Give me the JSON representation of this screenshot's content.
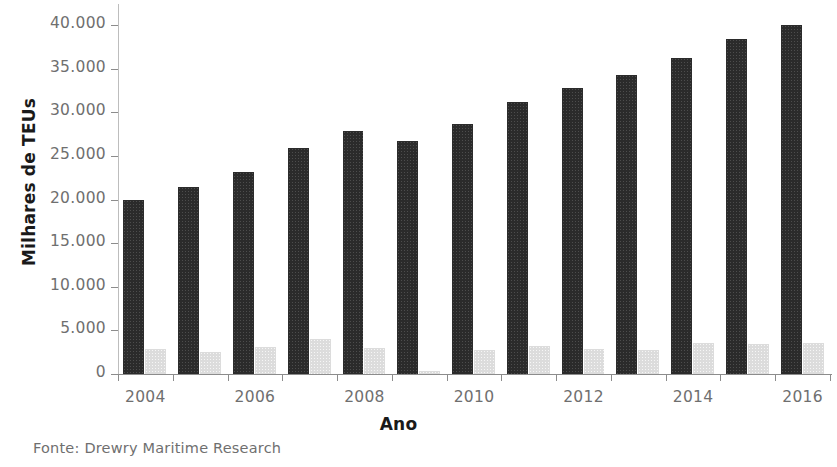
{
  "figure": {
    "title_remnant": "",
    "source_note": "Fonte: Drewry Maritime Research"
  },
  "axes": {
    "ylabel": "Milhares de TEUs",
    "xlabel": "Ano",
    "ytick_labels": [
      "40.000",
      "35.000",
      "30.000",
      "25.000",
      "20.000",
      "15.000",
      "10.000",
      "5.000",
      "0"
    ],
    "xtick_labels": [
      "2004",
      "2006",
      "2008",
      "2010",
      "2012",
      "2014",
      "2016"
    ]
  },
  "colors": {
    "series_dark": "#2b2b2b",
    "series_light": "#dcdcdc",
    "axis": "#8c8c8c",
    "tick_text": "#6f6f6f",
    "axis_title": "#1a1a1a",
    "background": "#ffffff"
  },
  "chart_data": {
    "type": "bar",
    "title": "",
    "xlabel": "Ano",
    "ylabel": "Milhares de TEUs",
    "ylim": [
      0,
      40000
    ],
    "yticks": [
      0,
      5000,
      10000,
      15000,
      20000,
      25000,
      30000,
      35000,
      40000
    ],
    "grid": false,
    "legend_position": "none",
    "categories": [
      "2004",
      "2005",
      "2006",
      "2007",
      "2008",
      "2009",
      "2010",
      "2011",
      "2012",
      "2013",
      "2014",
      "2015",
      "2016"
    ],
    "xtick_labels_shown": [
      "2004",
      "2006",
      "2008",
      "2010",
      "2012",
      "2014",
      "2016"
    ],
    "series": [
      {
        "name": "serie-escura",
        "color": "#2b2b2b",
        "values": [
          20000,
          21400,
          23200,
          25900,
          27800,
          26700,
          28600,
          31200,
          32800,
          34300,
          36200,
          38400,
          40000
        ]
      },
      {
        "name": "serie-clara",
        "color": "#dcdcdc",
        "values": [
          2900,
          2500,
          3100,
          4000,
          3000,
          300,
          2800,
          3200,
          2900,
          2700,
          3500,
          3400,
          3500
        ]
      }
    ],
    "units": "milhares de TEUs",
    "source": "Drewry Maritime Research"
  }
}
